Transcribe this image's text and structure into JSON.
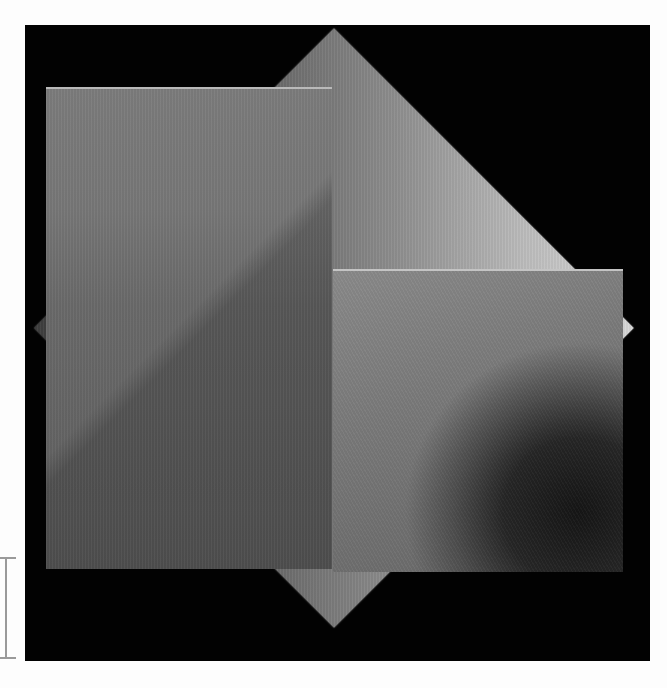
{
  "image": {
    "description": "Black square field with three overlapping brushed-metal panels: a large rotated square (diamond), a vertical rectangle on the left, and a square on the lower right",
    "background_color": "#020202",
    "page_color": "#fdfdfd"
  },
  "shapes": [
    {
      "name": "diamond",
      "kind": "rotated-square",
      "tone": "silver-gradient",
      "highlight": "#d9d9d9"
    },
    {
      "name": "left-rectangle",
      "kind": "rectangle",
      "tone": "medium-gray",
      "color": "#777777"
    },
    {
      "name": "right-square",
      "kind": "square",
      "tone": "gray-with-dark-radial-blot",
      "color": "#7a7a7a"
    }
  ],
  "cursor": {
    "type": "i-beam-icon",
    "color": "#9a9a9a"
  }
}
